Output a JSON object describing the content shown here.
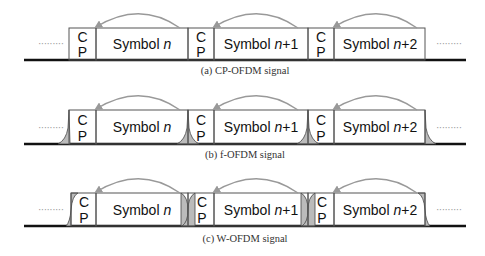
{
  "diagram": {
    "panels": [
      {
        "id": "a",
        "caption": "(a) CP-OFDM signal",
        "cp_label_top": "C",
        "cp_label_bottom": "P",
        "symbols": [
          {
            "prefix": "Symbol ",
            "index": "n",
            "suffix": ""
          },
          {
            "prefix": "Symbol ",
            "index": "n",
            "suffix": "+1"
          },
          {
            "prefix": "Symbol ",
            "index": "n",
            "suffix": "+2"
          }
        ],
        "ellipsis_left": "·········",
        "ellipsis_right": "·········"
      },
      {
        "id": "b",
        "caption": "(b) f-OFDM signal",
        "cp_label_top": "C",
        "cp_label_bottom": "P",
        "symbols": [
          {
            "prefix": "Symbol ",
            "index": "n",
            "suffix": ""
          },
          {
            "prefix": "Symbol ",
            "index": "n",
            "suffix": "+1"
          },
          {
            "prefix": "Symbol ",
            "index": "n",
            "suffix": "+2"
          }
        ],
        "ellipsis_left": "·········",
        "ellipsis_right": "·········"
      },
      {
        "id": "c",
        "caption": "(c) W-OFDM signal",
        "cp_label_top": "C",
        "cp_label_bottom": "P",
        "symbols": [
          {
            "prefix": "Symbol ",
            "index": "n",
            "suffix": ""
          },
          {
            "prefix": "Symbol ",
            "index": "n",
            "suffix": "+1"
          },
          {
            "prefix": "Symbol ",
            "index": "n",
            "suffix": "+2"
          }
        ],
        "ellipsis_left": "·········",
        "ellipsis_right": "·········"
      }
    ]
  }
}
